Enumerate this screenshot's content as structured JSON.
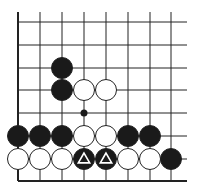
{
  "diagram": {
    "type": "go-board-fragment",
    "colors": {
      "line": "#222222",
      "black": "#1a1a1a",
      "white": "#ffffff",
      "background": "#ffffff",
      "triangle": "#ffffff"
    },
    "grid": {
      "cols_x": [
        18,
        40,
        62,
        84,
        106,
        128,
        150,
        171
      ],
      "rows_y": [
        22,
        45,
        68,
        90,
        113,
        136,
        159,
        181
      ],
      "h_line_end_x": 187,
      "v_line_start_y": 12,
      "left_edge": true,
      "bottom_edge": true
    },
    "stones": [
      {
        "color": "black",
        "col": 2,
        "row": 2
      },
      {
        "color": "black",
        "col": 2,
        "row": 3
      },
      {
        "color": "white",
        "col": 3,
        "row": 3
      },
      {
        "color": "white",
        "col": 4,
        "row": 3
      },
      {
        "color": "black",
        "col": 0,
        "row": 5
      },
      {
        "color": "black",
        "col": 1,
        "row": 5
      },
      {
        "color": "black",
        "col": 2,
        "row": 5
      },
      {
        "color": "white",
        "col": 3,
        "row": 5
      },
      {
        "color": "white",
        "col": 4,
        "row": 5
      },
      {
        "color": "black",
        "col": 5,
        "row": 5
      },
      {
        "color": "black",
        "col": 6,
        "row": 5
      },
      {
        "color": "white",
        "col": 0,
        "row": 6
      },
      {
        "color": "white",
        "col": 1,
        "row": 6
      },
      {
        "color": "white",
        "col": 2,
        "row": 6
      },
      {
        "color": "black",
        "col": 3,
        "row": 6,
        "marker": "triangle"
      },
      {
        "color": "black",
        "col": 4,
        "row": 6,
        "marker": "triangle"
      },
      {
        "color": "white",
        "col": 5,
        "row": 6
      },
      {
        "color": "white",
        "col": 6,
        "row": 6
      },
      {
        "color": "black",
        "col": 7,
        "row": 6
      }
    ],
    "markers": [
      {
        "type": "dot",
        "color": "black",
        "col": 3,
        "row": 4
      }
    ]
  }
}
